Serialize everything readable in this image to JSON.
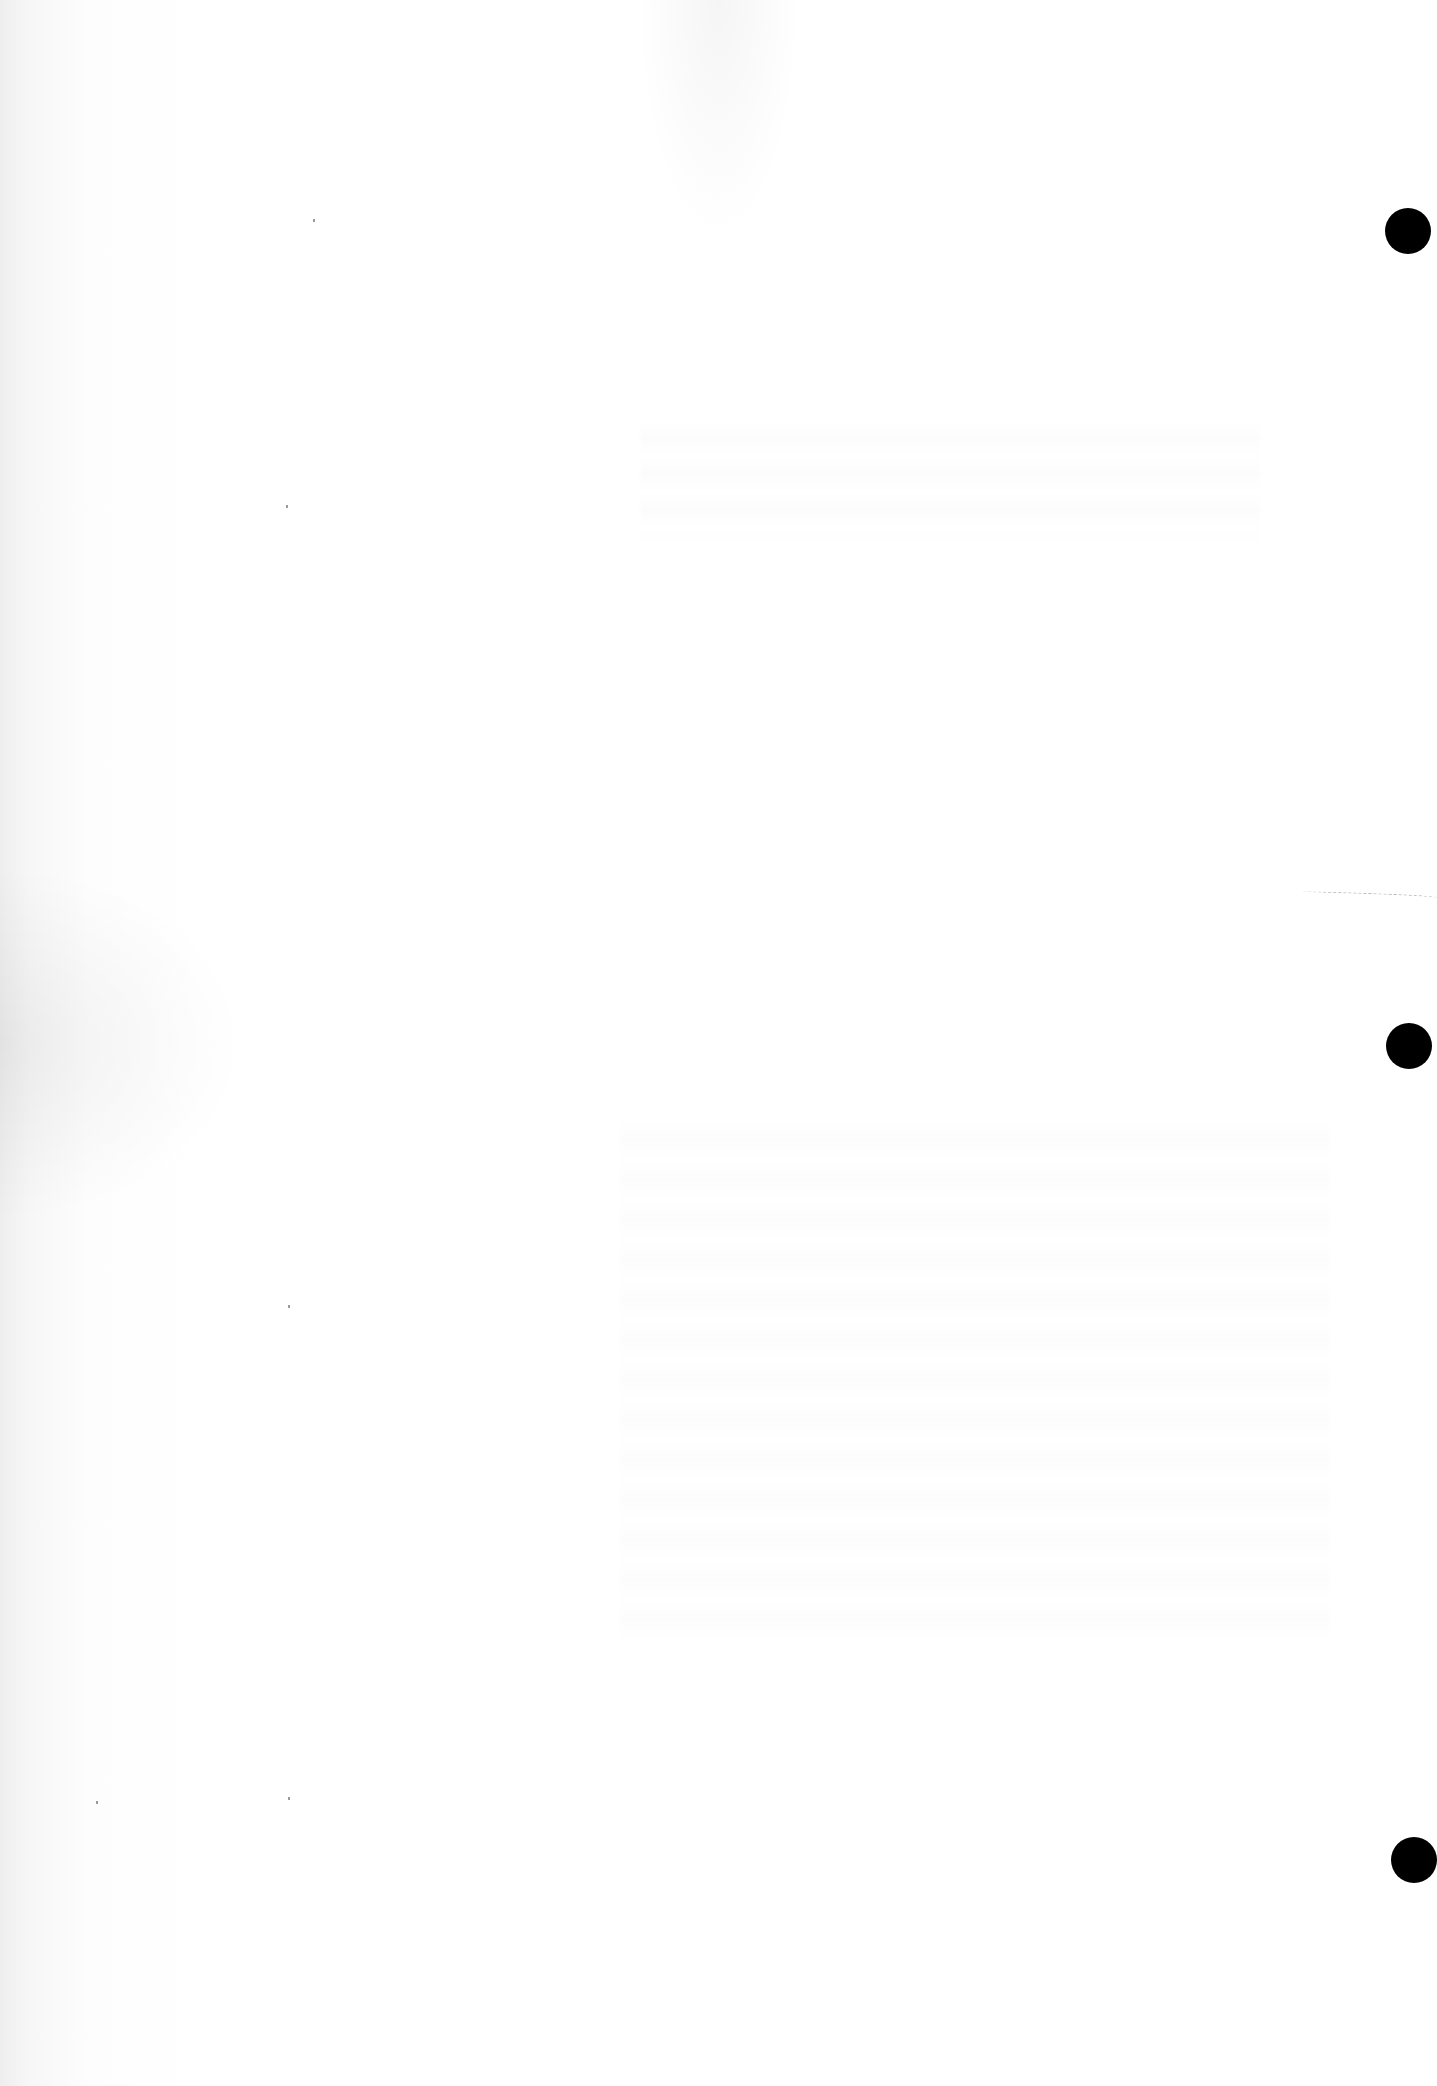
{
  "page": {
    "type": "blank scanned page",
    "background_color": "#ffffff",
    "text_content": ""
  },
  "punch_holes": [
    {
      "name": "top",
      "color": "#000000"
    },
    {
      "name": "middle",
      "color": "#000000"
    },
    {
      "name": "bottom",
      "color": "#000000"
    }
  ]
}
